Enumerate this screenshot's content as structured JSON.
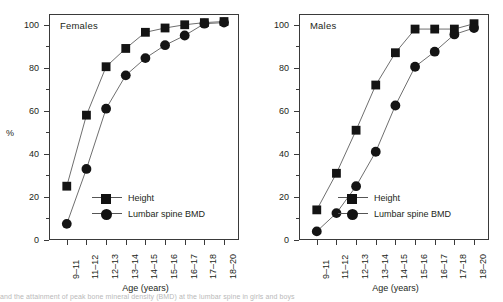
{
  "figure": {
    "xlabel": "Age (years)",
    "ylabel": "%",
    "caption_fragment": "and the attainment of peak bone mineral density (BMD) at the lumbar spine in girls and boys"
  },
  "chart_data": [
    {
      "type": "line",
      "title": "Females",
      "xlabel": "Age (years)",
      "ylabel": "%",
      "ylim": [
        0,
        105
      ],
      "yticks": [
        0,
        20,
        40,
        60,
        80,
        100
      ],
      "yticks_minor": [
        10,
        30,
        50,
        70,
        90
      ],
      "grid": false,
      "legend_position": "lower right inside",
      "categories": [
        "9–11",
        "11–12",
        "12–13",
        "13–14",
        "14–15",
        "15–16",
        "16–17",
        "17–18",
        "18–20"
      ],
      "series": [
        {
          "name": "Height",
          "marker": "square",
          "values": [
            25,
            58,
            80.5,
            89,
            96.5,
            98.5,
            100,
            101,
            101.5
          ]
        },
        {
          "name": "Lumbar spine BMD",
          "marker": "circle",
          "values": [
            7.5,
            33,
            61,
            76.5,
            84.5,
            90.5,
            95,
            100.5,
            101
          ]
        }
      ]
    },
    {
      "type": "line",
      "title": "Males",
      "xlabel": "Age (years)",
      "ylabel": "%",
      "ylim": [
        0,
        105
      ],
      "yticks": [
        0,
        20,
        40,
        60,
        80,
        100
      ],
      "yticks_minor": [
        10,
        30,
        50,
        70,
        90
      ],
      "grid": false,
      "legend_position": "lower right inside",
      "categories": [
        "9–11",
        "11–12",
        "12–13",
        "13–14",
        "14–15",
        "15–16",
        "16–17",
        "17–18",
        "18–20"
      ],
      "series": [
        {
          "name": "Height",
          "marker": "square",
          "values": [
            14,
            31,
            51,
            72,
            87,
            98,
            98,
            98,
            100.5
          ]
        },
        {
          "name": "Lumbar spine BMD",
          "marker": "circle",
          "values": [
            4,
            12.5,
            25,
            41,
            62.5,
            80.5,
            87.5,
            95.5,
            98.5
          ]
        }
      ]
    }
  ]
}
